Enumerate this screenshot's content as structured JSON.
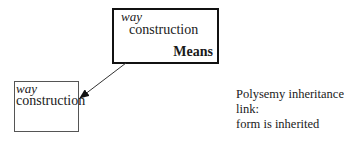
{
  "parent_node": {
    "form_label": "way",
    "name": "construction",
    "sense": "Means"
  },
  "child_node": {
    "form_label": "way",
    "name": "construction"
  },
  "link": {
    "type": "polysemy-inheritance",
    "caption_line1": "Polysemy inheritance link:",
    "caption_line2": "form is inherited"
  }
}
